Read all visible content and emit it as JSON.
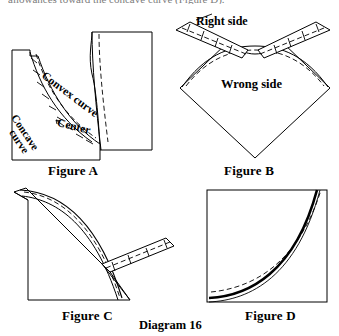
{
  "page": {
    "background_color": "#ffffff",
    "ink_color": "#000000",
    "width": 339,
    "height": 336
  },
  "top_text": {
    "clipped_line": "allowances toward the concave curve (Figure D)."
  },
  "figures": [
    {
      "id": "A",
      "caption": "Figure A",
      "labels": [
        {
          "name": "convex-curve-label",
          "text": "Convex curve"
        },
        {
          "name": "concave-curve-label-line1",
          "text": "Concave"
        },
        {
          "name": "concave-curve-label-line2",
          "text": "curve"
        },
        {
          "name": "center-label",
          "text": "Center"
        }
      ]
    },
    {
      "id": "B",
      "caption": "Figure B",
      "labels": [
        {
          "name": "right-side-label",
          "text": "Right side"
        },
        {
          "name": "wrong-side-label",
          "text": "Wrong side"
        }
      ]
    },
    {
      "id": "C",
      "caption": "Figure C",
      "labels": []
    },
    {
      "id": "D",
      "caption": "Figure D",
      "labels": []
    }
  ],
  "captions": {
    "figure_a": "Figure A",
    "figure_b": "Figure B",
    "figure_c": "Figure C",
    "figure_d": "Figure D",
    "diagram": "Diagram 16"
  },
  "labels": {
    "convex_curve": "Convex curve",
    "concave_curve_line1": "Concave",
    "concave_curve_line2": "curve",
    "center": "Center",
    "right_side": "Right side",
    "wrong_side": "Wrong side"
  }
}
